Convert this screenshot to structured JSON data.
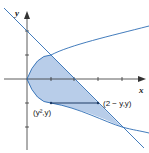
{
  "diagram": {
    "axes": {
      "x_label": "x",
      "y_label": "y"
    },
    "curves": [
      {
        "name": "parabola",
        "equation": "x = y^2"
      },
      {
        "name": "line",
        "equation": "x = 2 - y"
      }
    ],
    "labels": {
      "left_point": "(y²,y)",
      "right_point": "(2 − y,y)"
    },
    "colors": {
      "fill": "#b8cde9",
      "curve": "#2e6db4",
      "axis": "#333333"
    }
  }
}
